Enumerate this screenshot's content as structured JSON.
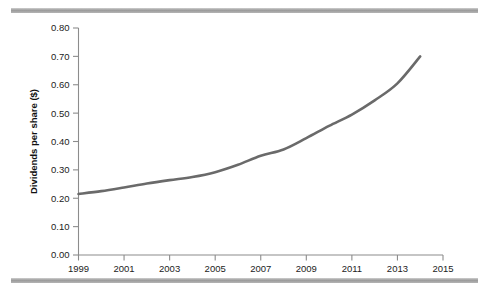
{
  "figure": {
    "top_rule": "decorative-rule",
    "bottom_rule": "decorative-rule"
  },
  "chart_data": {
    "type": "line",
    "title": "",
    "subtitle": "",
    "xlabel": "",
    "ylabel": "Dividends per share ($)",
    "xlim": [
      1999,
      2015
    ],
    "ylim": [
      0.0,
      0.8
    ],
    "grid": false,
    "legend": false,
    "legend_position": "none",
    "line_color": "#6a6a6a",
    "x_tick_labels": [
      "1999",
      "2001",
      "2003",
      "2005",
      "2007",
      "2009",
      "2011",
      "2013",
      "2015"
    ],
    "x_tick_values": [
      1999,
      2001,
      2003,
      2005,
      2007,
      2009,
      2011,
      2013,
      2015
    ],
    "y_tick_labels": [
      "0.00",
      "0.10",
      "0.20",
      "0.30",
      "0.40",
      "0.50",
      "0.60",
      "0.70",
      "0.80"
    ],
    "y_tick_values": [
      0.0,
      0.1,
      0.2,
      0.3,
      0.4,
      0.5,
      0.6,
      0.7,
      0.8
    ],
    "x": [
      1999,
      2000,
      2001,
      2002,
      2003,
      2004,
      2005,
      2006,
      2007,
      2008,
      2009,
      2010,
      2011,
      2012,
      2013,
      2014
    ],
    "values": [
      0.215,
      0.225,
      0.238,
      0.252,
      0.264,
      0.275,
      0.292,
      0.318,
      0.35,
      0.372,
      0.412,
      0.455,
      0.495,
      0.545,
      0.605,
      0.7
    ],
    "series": [
      {
        "name": "Dividends per share",
        "values": [
          0.215,
          0.225,
          0.238,
          0.252,
          0.264,
          0.275,
          0.292,
          0.318,
          0.35,
          0.372,
          0.412,
          0.455,
          0.495,
          0.545,
          0.605,
          0.7
        ]
      }
    ]
  }
}
